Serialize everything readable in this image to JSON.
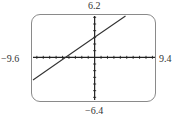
{
  "chart_data": {
    "type": "line",
    "title": "",
    "xlabel": "",
    "ylabel": "",
    "window": {
      "xmin": -9.6,
      "xmax": 9.4,
      "ymin": -6.4,
      "ymax": 6.2,
      "xscl": 1,
      "yscl": 1
    },
    "window_labels": {
      "top": "6.2",
      "bottom": "−6.4",
      "left": "−9.6",
      "right": "9.4"
    },
    "grid": false,
    "series": [
      {
        "name": "y = (2/3)x + 3",
        "equation": "y = (2/3)x + 3",
        "slope": 0.667,
        "intercept": 3,
        "x": [
          -9.6,
          -4.5,
          0,
          4.8
        ],
        "y": [
          -3.4,
          0,
          3,
          6.2
        ]
      }
    ],
    "colors": {
      "line": "#333333",
      "axes": "#222222",
      "frame": "#8a8a8a"
    }
  }
}
